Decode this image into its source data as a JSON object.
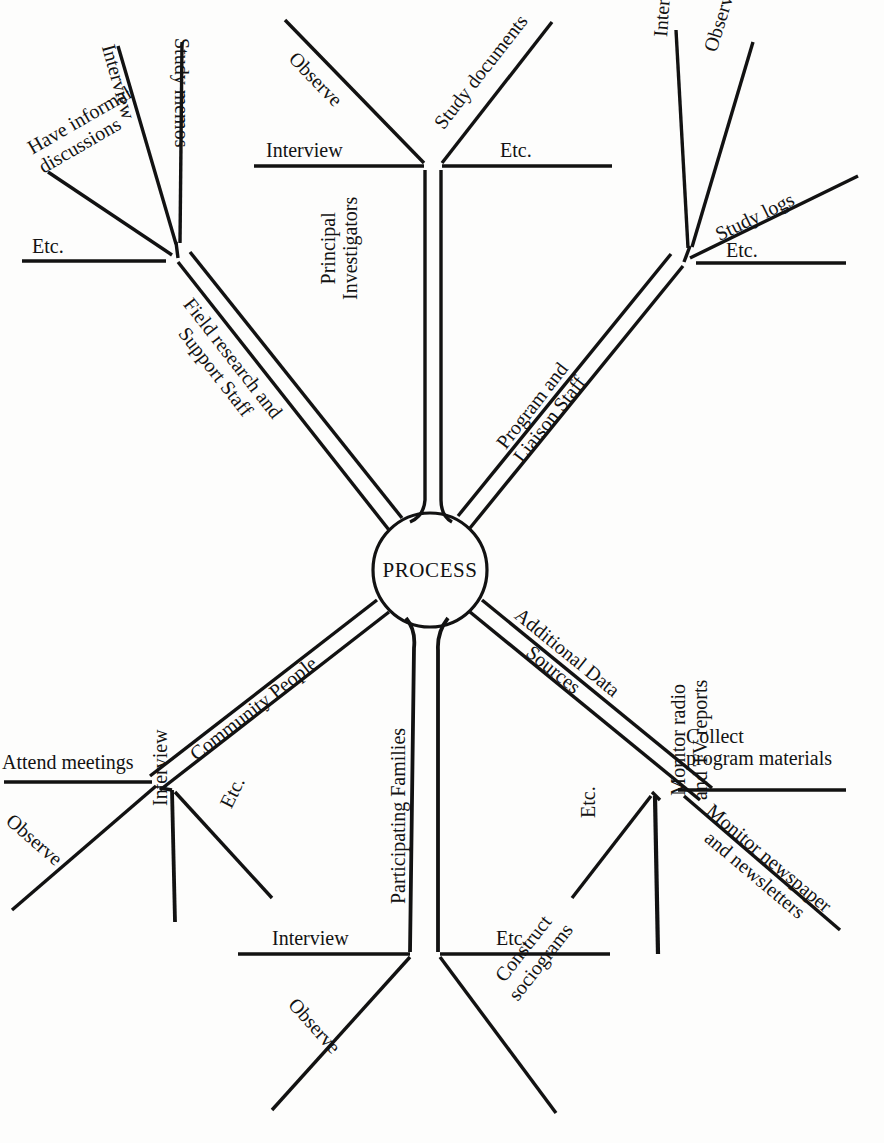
{
  "diagram": {
    "type": "radial-tree",
    "center_label": "PROCESS",
    "background_color": "#fdfdfc",
    "line_color": "#121212",
    "branches": [
      {
        "id": "field-research",
        "trunk_label": "Field research and\nSupport Staff",
        "direction": "upper-left",
        "twigs": [
          {
            "id": "etc-fr",
            "label": "Etc."
          },
          {
            "id": "have-informal-discussions",
            "label": "Have informal\ndiscussions"
          },
          {
            "id": "interview-fr",
            "label": "Interview"
          },
          {
            "id": "study-memos",
            "label": "Study memos"
          }
        ]
      },
      {
        "id": "principal-investigators",
        "trunk_label": "Principal\nInvestigators",
        "direction": "up",
        "twigs": [
          {
            "id": "interview-pi",
            "label": "Interview"
          },
          {
            "id": "observe-pi",
            "label": "Observe"
          },
          {
            "id": "study-documents",
            "label": "Study documents"
          },
          {
            "id": "etc-pi",
            "label": "Etc."
          }
        ]
      },
      {
        "id": "program-liaison",
        "trunk_label": "Program and\nLiaison Staff",
        "direction": "upper-right",
        "twigs": [
          {
            "id": "interview-pl",
            "label": "Interview"
          },
          {
            "id": "observe-pl",
            "label": "Observe"
          },
          {
            "id": "study-logs",
            "label": "Study logs"
          },
          {
            "id": "etc-pl",
            "label": "Etc."
          }
        ]
      },
      {
        "id": "community-people",
        "trunk_label": "Community People",
        "direction": "lower-left",
        "twigs": [
          {
            "id": "attend-meetings",
            "label": "Attend meetings"
          },
          {
            "id": "observe-cp",
            "label": "Observe"
          },
          {
            "id": "interview-cp",
            "label": "Interview"
          },
          {
            "id": "etc-cp",
            "label": "Etc."
          }
        ]
      },
      {
        "id": "participating-families",
        "trunk_label": "Participating Families",
        "direction": "down",
        "twigs": [
          {
            "id": "interview-pf",
            "label": "Interview"
          },
          {
            "id": "observe-pf",
            "label": "Observe"
          },
          {
            "id": "etc-pf",
            "label": "Etc."
          },
          {
            "id": "construct-sociograms",
            "label": "Construct\nsociograms"
          }
        ]
      },
      {
        "id": "additional-data-sources",
        "trunk_label": "Additional Data\nSources",
        "direction": "lower-right",
        "twigs": [
          {
            "id": "collect-program-materials",
            "label": "Collect\nprogram materials"
          },
          {
            "id": "monitor-newspaper",
            "label": "Monitor newspaper\nand newsletters"
          },
          {
            "id": "monitor-radio-tv",
            "label": "Monitor radio\nand TV reports"
          },
          {
            "id": "etc-ads",
            "label": "Etc."
          }
        ]
      }
    ]
  }
}
